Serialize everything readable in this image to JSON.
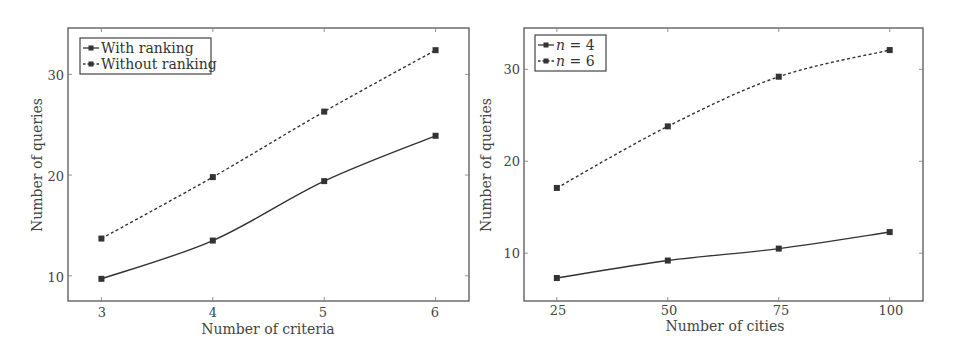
{
  "chart_data": [
    {
      "type": "line",
      "title": "",
      "xlabel": "Number of criteria",
      "ylabel": "Number of queries",
      "x": [
        3,
        4,
        5,
        6
      ],
      "x_tick_labels": [
        "3",
        "4",
        "5",
        "6"
      ],
      "y_ticks": [
        10,
        20,
        30
      ],
      "y_tick_labels": [
        "10",
        "20",
        "30"
      ],
      "xlim": [
        2.7,
        6.3
      ],
      "ylim": [
        7.5,
        34.6
      ],
      "grid": false,
      "legend_position": "upper left",
      "series": [
        {
          "name": "With ranking",
          "style": "solid",
          "marker": "square",
          "values": [
            9.7,
            13.5,
            19.4,
            23.9
          ]
        },
        {
          "name": "Without ranking",
          "style": "dashed",
          "marker": "square",
          "values": [
            13.7,
            19.8,
            26.3,
            32.4
          ]
        }
      ]
    },
    {
      "type": "line",
      "title": "",
      "xlabel": "Number of cities",
      "ylabel": "Number of queries",
      "x": [
        25,
        50,
        75,
        100
      ],
      "x_tick_labels": [
        "25",
        "50",
        "75",
        "100"
      ],
      "y_ticks": [
        10,
        20,
        30
      ],
      "y_tick_labels": [
        "10",
        "20",
        "30"
      ],
      "xlim": [
        17.6,
        107.5
      ],
      "ylim": [
        4.8,
        34.5
      ],
      "grid": false,
      "legend_position": "upper left",
      "series": [
        {
          "name": "n = 4",
          "legend_var": "n",
          "legend_rest": " = 4",
          "style": "solid",
          "marker": "square",
          "values": [
            7.3,
            9.2,
            10.5,
            12.3
          ]
        },
        {
          "name": "n = 6",
          "legend_var": "n",
          "legend_rest": " = 6",
          "style": "dashed",
          "marker": "square",
          "values": [
            17.1,
            23.8,
            29.2,
            32.1
          ]
        }
      ]
    }
  ],
  "colors": {
    "line": "#333333",
    "frame": "#555555",
    "text": "#444444"
  }
}
